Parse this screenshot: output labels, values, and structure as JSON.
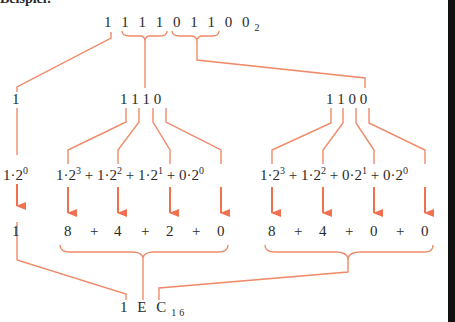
{
  "caption": "Beispiel:",
  "binary": {
    "digits": "1 1 1 1 0 1 1 0 0",
    "base": "2"
  },
  "groups": [
    {
      "nibble": "1",
      "expansion_parts": [
        "1·2",
        "0"
      ],
      "values": [
        "1"
      ]
    },
    {
      "nibble": "1 1 1 0",
      "terms": [
        {
          "coef": "1",
          "exp": "3",
          "value": "8"
        },
        {
          "coef": "1",
          "exp": "2",
          "value": "4"
        },
        {
          "coef": "1",
          "exp": "1",
          "value": "2"
        },
        {
          "coef": "0",
          "exp": "0",
          "value": "0"
        }
      ]
    },
    {
      "nibble": "1 1 0 0",
      "terms": [
        {
          "coef": "1",
          "exp": "3",
          "value": "8"
        },
        {
          "coef": "1",
          "exp": "2",
          "value": "4"
        },
        {
          "coef": "0",
          "exp": "1",
          "value": "0"
        },
        {
          "coef": "0",
          "exp": "0",
          "value": "0"
        }
      ]
    }
  ],
  "operators": {
    "plus": "+",
    "dot": "·"
  },
  "result": {
    "digits": "1 E C",
    "base": "16"
  },
  "colors": {
    "connector": "#f08060",
    "arrow": "#f07050",
    "text": "#2a2a2a"
  }
}
